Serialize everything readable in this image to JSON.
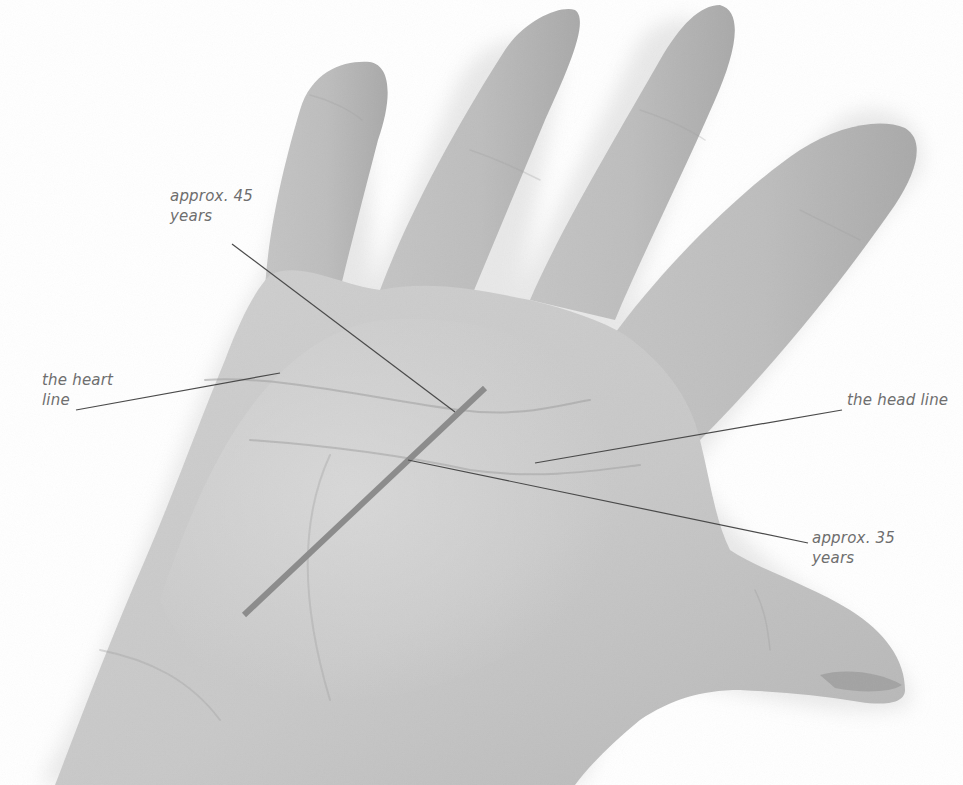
{
  "figure": {
    "colors": {
      "background": "#ffffff",
      "skin": "#c9c9c9",
      "skin_light": "#d8d8d8",
      "skin_dark": "#a9a9a9",
      "shadow": "#e6e6e6",
      "label_text": "#6e6e6e",
      "leader_line": "#4a4a4a",
      "timeline_bar": "#8c8c8c"
    },
    "labels": [
      {
        "id": "age45",
        "lines": [
          "approx. 45",
          "years"
        ],
        "x": 170,
        "y": 186
      },
      {
        "id": "heart",
        "lines": [
          "the heart",
          "line"
        ],
        "x": 42,
        "y": 370
      },
      {
        "id": "head",
        "lines": [
          "the head line"
        ],
        "x": 847,
        "y": 390
      },
      {
        "id": "age35",
        "lines": [
          "approx. 35",
          "years"
        ],
        "x": 812,
        "y": 528
      }
    ],
    "leader_lines": [
      {
        "id": "age45-leader",
        "x1": 232,
        "y1": 244,
        "x2": 455,
        "y2": 412
      },
      {
        "id": "heart-leader",
        "x1": 76,
        "y1": 410,
        "x2": 280,
        "y2": 373
      },
      {
        "id": "head-leader",
        "x1": 842,
        "y1": 410,
        "x2": 535,
        "y2": 463
      },
      {
        "id": "age35-leader",
        "x1": 808,
        "y1": 543,
        "x2": 408,
        "y2": 460
      }
    ],
    "timeline_bar": {
      "x1": 485,
      "y1": 388,
      "x2": 244,
      "y2": 615,
      "width": 6
    }
  }
}
